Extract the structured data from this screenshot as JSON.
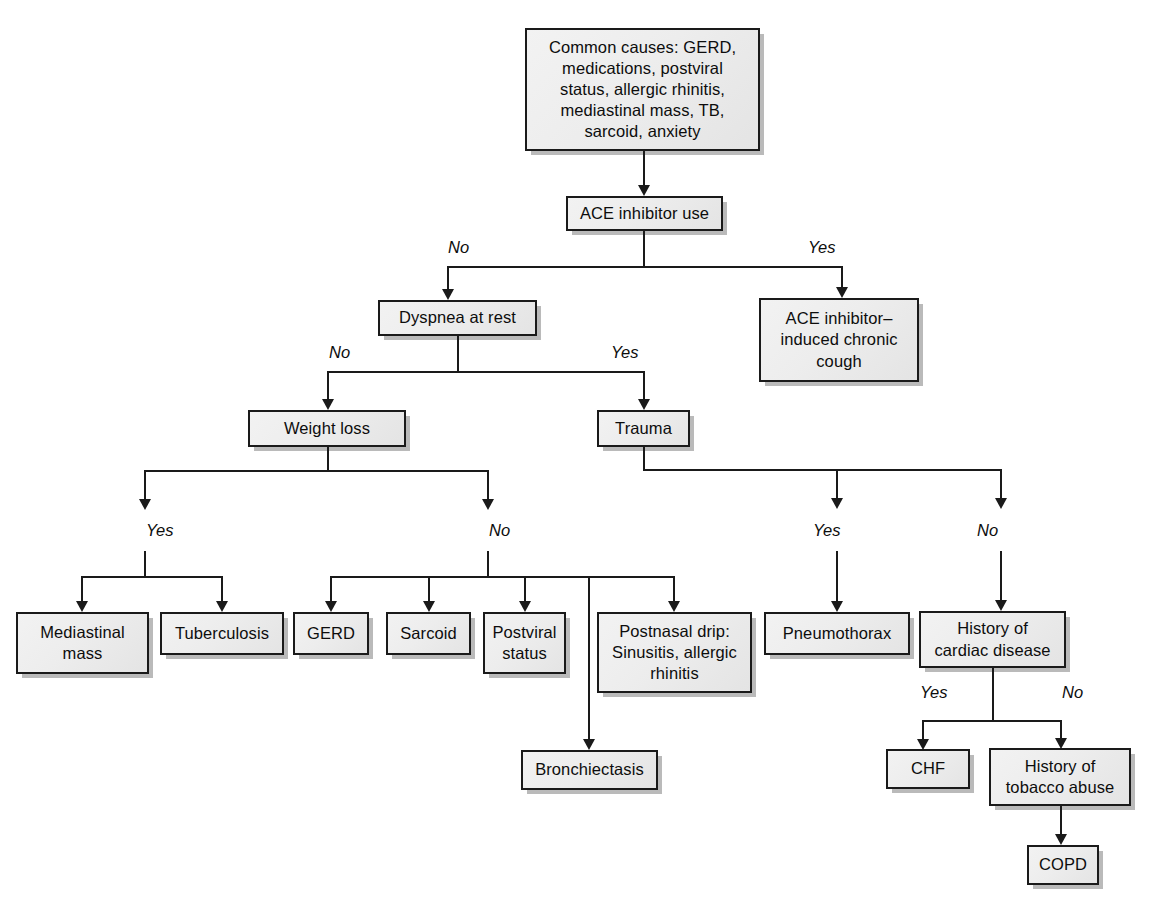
{
  "diagram": {
    "nodes": {
      "common_causes": "Common causes: GERD,\nmedications, postviral\nstatus, allergic rhinitis,\nmediastinal mass, TB,\nsarcoid, anxiety",
      "ace_inhibitor_use": "ACE inhibitor use",
      "ace_induced_cough": "ACE inhibitor–\ninduced chronic\ncough",
      "dyspnea_at_rest": "Dyspnea at rest",
      "weight_loss": "Weight loss",
      "trauma": "Trauma",
      "mediastinal_mass": "Mediastinal\nmass",
      "tuberculosis": "Tuberculosis",
      "gerd": "GERD",
      "sarcoid": "Sarcoid",
      "postviral_status": "Postviral\nstatus",
      "postnasal_drip": "Postnasal drip:\nSinusitis, allergic\nrhinitis",
      "bronchiectasis": "Bronchiectasis",
      "pneumothorax": "Pneumothorax",
      "cardiac_history": "History of\ncardiac disease",
      "chf": "CHF",
      "tobacco_history": "History of\ntobacco abuse",
      "copd": "COPD"
    },
    "branch_labels": {
      "ace_no": "No",
      "ace_yes": "Yes",
      "dyspnea_no": "No",
      "dyspnea_yes": "Yes",
      "weightloss_yes": "Yes",
      "weightloss_no": "No",
      "trauma_yes": "Yes",
      "trauma_no": "No",
      "cardiac_yes": "Yes",
      "cardiac_no": "No"
    },
    "colors": {
      "node_fill": "#ededed",
      "node_border": "#1a1a1a",
      "line": "#1a1a1a",
      "shadow": "#8b8b8b",
      "background": "#ffffff"
    }
  }
}
